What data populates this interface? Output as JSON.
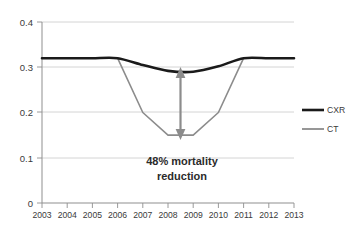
{
  "chart_data": {
    "type": "line",
    "title": "",
    "xlabel": "",
    "ylabel": "",
    "grid": true,
    "legend_position": "right",
    "x": [
      2003,
      2004,
      2005,
      2006,
      2007,
      2008,
      2009,
      2010,
      2011,
      2012,
      2013
    ],
    "categories": [
      "2003",
      "2004",
      "2005",
      "2006",
      "2007",
      "2008",
      "2009",
      "2010",
      "2011",
      "2012",
      "2013"
    ],
    "xlim": [
      2003,
      2013
    ],
    "ylim": [
      0,
      0.4
    ],
    "yticks": [
      0,
      0.1,
      0.2,
      0.3,
      0.4
    ],
    "ytick_labels": [
      "0",
      "0.1",
      "0.2",
      "0.3",
      "0.4"
    ],
    "series": [
      {
        "name": "CXR",
        "color": "#1a1a1a",
        "width": 2.6,
        "values": [
          0.32,
          0.32,
          0.32,
          0.32,
          0.305,
          0.292,
          0.29,
          0.302,
          0.32,
          0.32,
          0.32
        ]
      },
      {
        "name": "CT",
        "color": "#8c8c8c",
        "width": 1.6,
        "values": [
          0.32,
          0.32,
          0.32,
          0.32,
          0.2,
          0.15,
          0.15,
          0.2,
          0.32,
          0.32,
          0.32
        ]
      }
    ],
    "annotations": [
      {
        "name": "mortality-reduction-label",
        "line1": "48% mortality",
        "line2": "reduction",
        "x": 2008.5,
        "y": 0.075
      },
      {
        "name": "mortality-gap-arrow",
        "kind": "double-headed-arrow",
        "x": 2008.5,
        "y_top": 0.292,
        "y_bottom": 0.152,
        "color": "#8c8c8c"
      }
    ]
  },
  "axes": {
    "y_labels": [
      "0.4",
      "0.3",
      "0.2",
      "0.1",
      "0"
    ],
    "x_labels": [
      "2003",
      "2004",
      "2005",
      "2006",
      "2007",
      "2008",
      "2009",
      "2010",
      "2011",
      "2012",
      "2013"
    ]
  },
  "legend": {
    "items": [
      {
        "label": "CXR",
        "color": "#1a1a1a"
      },
      {
        "label": "CT",
        "color": "#8c8c8c"
      }
    ]
  },
  "colors": {
    "cxr": "#1a1a1a",
    "ct": "#8c8c8c",
    "grid": "#c9c9c9",
    "axis": "#8f8f8f",
    "text": "#3a3a3a",
    "background": "#ffffff"
  }
}
